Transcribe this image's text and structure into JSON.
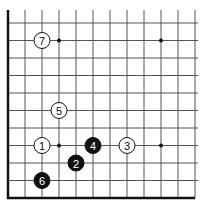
{
  "diagram": {
    "type": "go-board-corner",
    "edges": [
      "left",
      "bottom"
    ],
    "colors": {
      "background": "#ffffff",
      "grid_line": "#555555",
      "edge_line": "#111111",
      "black_stone": "#111111",
      "white_stone": "#ffffff",
      "star_point": "#111111"
    },
    "grid": {
      "columns": 11,
      "rows": 10,
      "origin_x": 8,
      "origin_y": 198,
      "spacing_x": 17,
      "spacing_y": 17.5
    },
    "star_points": [
      {
        "col": 3,
        "row": 9
      },
      {
        "col": 9,
        "row": 9
      },
      {
        "col": 3,
        "row": 3
      },
      {
        "col": 9,
        "row": 3
      }
    ],
    "stones": [
      {
        "move": "1",
        "color": "white",
        "col": 2,
        "row": 3
      },
      {
        "move": "2",
        "color": "black",
        "col": 4,
        "row": 2
      },
      {
        "move": "3",
        "color": "white",
        "col": 7,
        "row": 3
      },
      {
        "move": "4",
        "color": "black",
        "col": 5,
        "row": 3
      },
      {
        "move": "5",
        "color": "white",
        "col": 3,
        "row": 5
      },
      {
        "move": "6",
        "color": "black",
        "col": 2,
        "row": 1
      },
      {
        "move": "7",
        "color": "white",
        "col": 2,
        "row": 9
      }
    ]
  }
}
